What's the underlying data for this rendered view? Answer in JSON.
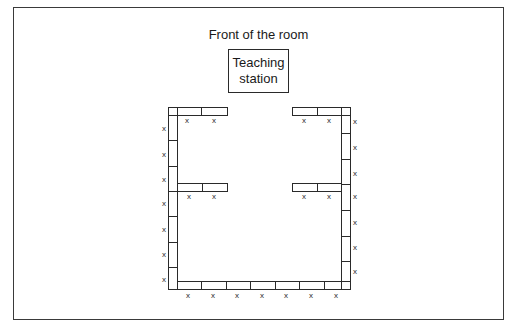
{
  "diagram": {
    "title": "Front of the room",
    "teaching_station": {
      "line1": "Teaching",
      "line2": "station"
    },
    "seat_marker": "x",
    "colors": {
      "stroke": "#2a2a2a",
      "background": "#ffffff",
      "frame": "#3a3a3a"
    },
    "layout": {
      "type": "U-shaped seating with interior wings",
      "desk_groups": [
        {
          "name": "top-left-row",
          "desks": 2,
          "seats": 2
        },
        {
          "name": "top-right-row",
          "desks": 2,
          "seats": 2
        },
        {
          "name": "left-column",
          "desks": 7,
          "seats": 9
        },
        {
          "name": "right-column",
          "desks": 7,
          "seats": 9
        },
        {
          "name": "middle-left-wing",
          "desks": 2,
          "seats": 2
        },
        {
          "name": "middle-right-wing",
          "desks": 2,
          "seats": 2
        },
        {
          "name": "bottom-row",
          "desks": 7,
          "seats": 7
        }
      ]
    }
  }
}
